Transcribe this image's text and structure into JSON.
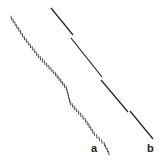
{
  "figure": {
    "panels": [
      {
        "label": "a",
        "style": "hatched-dashes",
        "color": "#333333",
        "path_points": [
          [
            11,
            18
          ],
          [
            24,
            38
          ],
          [
            38,
            56
          ],
          [
            55,
            74
          ],
          [
            66,
            88
          ],
          [
            70,
            103
          ],
          [
            76,
            110
          ],
          [
            85,
            120
          ],
          [
            94,
            134
          ],
          [
            104,
            144
          ],
          [
            110,
            156
          ]
        ]
      },
      {
        "label": "b",
        "style": "solid-segmented",
        "color": "#222222",
        "segments": [
          [
            [
              51,
              8
            ],
            [
              73,
              35
            ]
          ],
          [
            [
              71,
              38
            ],
            [
              102,
              77
            ]
          ],
          [
            [
              101,
              80
            ],
            [
              128,
              112
            ]
          ],
          [
            [
              130,
              111
            ],
            [
              153,
              139
            ]
          ]
        ]
      }
    ],
    "labels": {
      "a": "a",
      "b": "b"
    }
  }
}
